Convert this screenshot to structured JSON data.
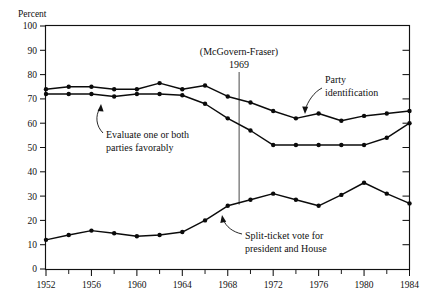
{
  "chart_data": {
    "type": "line",
    "title": "",
    "xlabel": "",
    "ylabel": "Percent",
    "ylim": [
      0,
      100
    ],
    "xlim": [
      1952,
      1984
    ],
    "ytick_step": 10,
    "yticks": [
      "0",
      "10",
      "20",
      "30",
      "40",
      "50",
      "60",
      "70",
      "80",
      "90",
      "100"
    ],
    "xticks": [
      "1952",
      "1956",
      "1960",
      "1964",
      "1968",
      "1972",
      "1976",
      "1980",
      "1984"
    ],
    "xtick_minor_step": 2,
    "grid": false,
    "legend_position": "inline-annotations",
    "x": [
      1952,
      1954,
      1956,
      1958,
      1960,
      1962,
      1964,
      1966,
      1968,
      1970,
      1972,
      1974,
      1976,
      1978,
      1980,
      1982,
      1984
    ],
    "series": [
      {
        "name": "Party identification",
        "values": [
          74,
          75,
          75,
          74,
          74,
          76.5,
          74,
          75.5,
          71,
          68.5,
          65,
          62,
          64,
          61,
          63,
          64,
          65
        ]
      },
      {
        "name": "Evaluate one or both parties favorably",
        "values": [
          72,
          72,
          72,
          71,
          72,
          72,
          71.5,
          68,
          62,
          57,
          51,
          51,
          51,
          51,
          51,
          54,
          60
        ]
      },
      {
        "name": "Split-ticket vote for president and House",
        "values": [
          12,
          14,
          15.8,
          14.7,
          13.5,
          14,
          15.2,
          20,
          26,
          28.5,
          31,
          28.5,
          26,
          30.5,
          35.5,
          31,
          27
        ]
      }
    ],
    "annotations": [
      {
        "id": "mcgovern-fraser",
        "line1": "(McGovern-Fraser)",
        "line2": "1969",
        "event_year": 1969
      },
      {
        "id": "party-identification",
        "line1": "Party",
        "line2": "identification"
      },
      {
        "id": "evaluate-parties",
        "line1": "Evaluate one or both",
        "line2": "parties favorably"
      },
      {
        "id": "split-ticket",
        "line1": "Split-ticket vote for",
        "line2": "president and House"
      }
    ],
    "colors": {
      "line": "#0b0b0b",
      "frame": "#111111",
      "background": "#ffffff",
      "event_line": "#333333"
    }
  }
}
